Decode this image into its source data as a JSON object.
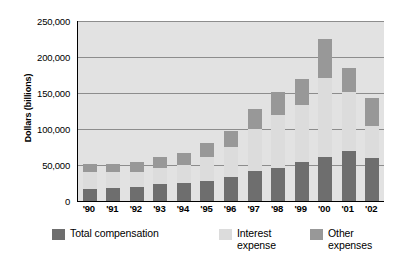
{
  "chart_data": {
    "type": "bar",
    "stacked": true,
    "title": "",
    "subtitle": "",
    "xlabel": "",
    "ylabel": "Dollars (billions)",
    "ylim": [
      0,
      250000
    ],
    "ytick_values": [
      0,
      50000,
      100000,
      150000,
      200000,
      250000
    ],
    "ytick_labels": [
      "0",
      "50,000",
      "100,000",
      "150,000",
      "200,000",
      "250,000"
    ],
    "grid": true,
    "grid_axis": "y",
    "legend_position": "bottom",
    "categories": [
      "'90",
      "'91",
      "'92",
      "'93",
      "'94",
      "'95",
      "'96",
      "'97",
      "'98",
      "'99",
      "'00",
      "'01",
      "'02"
    ],
    "series": [
      {
        "name": "Total compensation",
        "color": "#6e6e6e",
        "values": [
          17000,
          18000,
          20000,
          24000,
          25000,
          28000,
          33000,
          42000,
          46000,
          54000,
          61000,
          69000,
          60000
        ]
      },
      {
        "name": "Interest expense",
        "color": "#dcdcdc",
        "values": [
          23000,
          22000,
          20000,
          22000,
          25000,
          33000,
          42000,
          58000,
          74000,
          80000,
          110000,
          83000,
          44000
        ]
      },
      {
        "name": "Other expenses",
        "color": "#989898",
        "values": [
          12000,
          12000,
          14000,
          15000,
          17000,
          19000,
          22000,
          28000,
          31000,
          36000,
          54000,
          33000,
          39000
        ]
      }
    ],
    "totals": [
      52000,
      52000,
      54000,
      61000,
      67000,
      80000,
      97000,
      128000,
      151000,
      170000,
      225000,
      185000,
      143000
    ]
  },
  "legend": {
    "items": [
      {
        "label": "Total compensation",
        "color": "#6e6e6e"
      },
      {
        "label": "Interest\nexpense",
        "color": "#dcdcdc"
      },
      {
        "label": "Other\nexpenses",
        "color": "#989898"
      }
    ]
  },
  "colors": {
    "plot_background": "#e2e2e2",
    "gridline": "#8d8d8d",
    "axis": "#000000",
    "page_background": "#ffffff"
  }
}
